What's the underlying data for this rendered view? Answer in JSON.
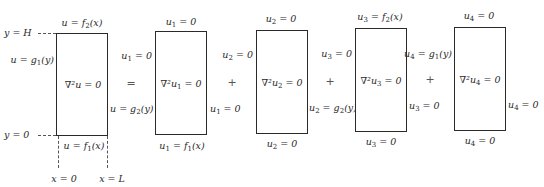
{
  "diagram": {
    "type": "superposition of Laplace equation on rectangle",
    "axes": {
      "y_top": "y = H",
      "y_bottom": "y = 0",
      "x_left": "x = 0",
      "x_right": "x = L"
    },
    "operators": [
      "=",
      "+",
      "+",
      "+"
    ],
    "boxes": [
      {
        "name": "original",
        "top": "u = f2(x)",
        "bottom": "u = f1(x)",
        "left": "u = g1(y)",
        "right": "u = g2(y)",
        "center": "∇²u = 0"
      },
      {
        "name": "u1",
        "top": "u1 = 0",
        "bottom": "u1 = f1(x)",
        "left": "u1 = 0",
        "right": "u1 = 0",
        "center": "∇²u1 = 0"
      },
      {
        "name": "u2",
        "top": "u2 = 0",
        "bottom": "u2 = 0",
        "left": "u2 = 0",
        "right": "u2 = g2(y)",
        "center": "∇²u2 = 0"
      },
      {
        "name": "u3",
        "top": "u3 = f2(x)",
        "bottom": "u3 = 0",
        "left": "u3 = 0",
        "right": "u3 = 0",
        "center": "∇²u3 = 0"
      },
      {
        "name": "u4",
        "top": "u4 = 0",
        "bottom": "u4 = 0",
        "left": "u4 = g1(y)",
        "right": "u4 = 0",
        "center": "∇²u4 = 0"
      }
    ]
  }
}
